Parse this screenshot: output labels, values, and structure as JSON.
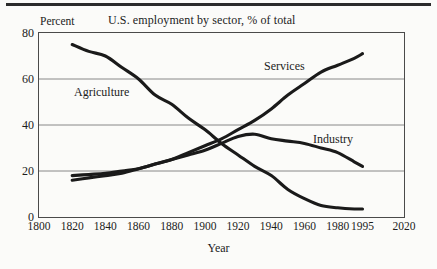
{
  "figure": {
    "title": "U.S. employment by sector, % of total",
    "y_axis_caption": "Percent",
    "x_axis_title": "Year",
    "line_color": "#1a1a1a",
    "grid_color": "#7a7a7a",
    "frame_color": "#4a4a4a",
    "rule_color": "#2b2b2b"
  },
  "chart_data": {
    "type": "line",
    "title": "U.S. employment by sector, % of total",
    "xlabel": "Year",
    "ylabel": "Percent",
    "xlim": [
      1800,
      2020
    ],
    "ylim": [
      0,
      80
    ],
    "yticks": [
      0,
      20,
      40,
      60,
      80
    ],
    "xticks": [
      1800,
      1820,
      1840,
      1860,
      1880,
      1900,
      1920,
      1940,
      1960,
      1980,
      1995,
      2020
    ],
    "xtick_labels": [
      "1800",
      "1820",
      "1840",
      "1860",
      "1880",
      "1900",
      "1920",
      "1940",
      "1960",
      "1980",
      "1995",
      "2020"
    ],
    "ytick_labels": [
      "0",
      "20",
      "40",
      "60",
      "80"
    ],
    "grid": "horizontal gridlines at 20, 40, 60",
    "legend": "inline series labels placed next to each curve",
    "series": [
      {
        "name": "Agriculture",
        "label_position": "left-upper",
        "x": [
          1820,
          1830,
          1840,
          1850,
          1860,
          1870,
          1880,
          1890,
          1900,
          1910,
          1920,
          1930,
          1940,
          1950,
          1960,
          1970,
          1980,
          1990,
          1995
        ],
        "values": [
          75,
          72,
          70,
          65,
          60,
          53,
          49,
          43,
          38,
          32,
          27,
          22,
          18,
          12,
          8,
          5,
          4,
          3.5,
          3.5
        ]
      },
      {
        "name": "Industry",
        "label_position": "right-middle",
        "x": [
          1820,
          1830,
          1840,
          1850,
          1860,
          1870,
          1880,
          1890,
          1900,
          1910,
          1920,
          1930,
          1940,
          1950,
          1960,
          1970,
          1980,
          1990,
          1995
        ],
        "values": [
          18,
          18.5,
          19,
          20,
          21,
          23,
          25,
          27,
          29,
          32,
          35,
          36,
          34,
          33,
          32,
          30,
          28,
          24,
          22
        ]
      },
      {
        "name": "Services",
        "label_position": "right-upper",
        "x": [
          1820,
          1830,
          1840,
          1850,
          1860,
          1870,
          1880,
          1890,
          1900,
          1910,
          1920,
          1930,
          1940,
          1950,
          1960,
          1970,
          1980,
          1990,
          1995
        ],
        "values": [
          16,
          17,
          18,
          19,
          21,
          23,
          25,
          28,
          31,
          34,
          38,
          42,
          47,
          53,
          58,
          63,
          66,
          69,
          71
        ]
      }
    ]
  }
}
